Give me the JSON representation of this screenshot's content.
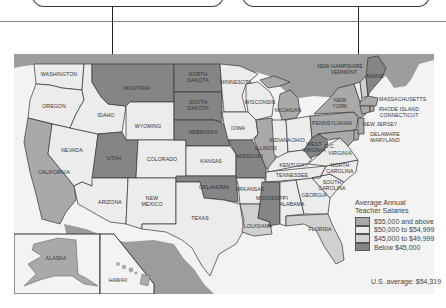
{
  "map": {
    "title": "Average Annual Teacher Salaries",
    "colors": {
      "water": "#f4f4f4",
      "canada": "#9c9c9c",
      "mexico": "#9c9c9c",
      "tier_55plus": "#a9a9a9",
      "tier_50_55": "#ececec",
      "tier_45_50": "#d0d0d0",
      "tier_below45": "#858585",
      "border": "#333333"
    },
    "states": {
      "washington": "WASHINGTON",
      "oregon": "OREGON",
      "california": "CALIFORNIA",
      "idaho": "IDAHO",
      "nevada": "NEVADA",
      "montana": "MONTANA",
      "wyoming": "WYOMING",
      "utah": "UTAH",
      "arizona": "ARIZONA",
      "colorado": "COLORADO",
      "new_mexico_1": "NEW",
      "new_mexico_2": "MEXICO",
      "north_dakota_1": "NORTH",
      "north_dakota_2": "DAKOTA",
      "south_dakota_1": "SOUTH",
      "south_dakota_2": "DAKOTA",
      "nebraska": "NEBRASKA",
      "kansas": "KANSAS",
      "oklahoma": "OKLAHOMA",
      "texas": "TEXAS",
      "minnesota": "MINNESOTA",
      "iowa": "IOWA",
      "missouri": "MISSOURI",
      "arkansas": "ARKANSAS",
      "louisiana": "LOUISIANA",
      "wisconsin": "WISCONSIN",
      "illinois": "ILLINOIS",
      "michigan": "MICHIGAN",
      "indiana": "INDIANA",
      "ohio": "OHIO",
      "kentucky": "KENTUCKY",
      "tennessee": "TENNESSEE",
      "mississippi": "MISSISSIPPI",
      "alabama": "ALABAMA",
      "georgia": "GEORGIA",
      "florida": "FLORIDA",
      "south_carolina_1": "SOUTH",
      "south_carolina_2": "CAROLINA",
      "north_carolina_1": "NORTH",
      "north_carolina_2": "CAROLINA",
      "virginia": "VIRGINIA",
      "west_virginia_1": "WEST",
      "west_virginia_2": "VIRGINIA",
      "dc": "D.C.",
      "pennsylvania": "PENNSYLVANIA",
      "new_york_1": "NEW",
      "new_york_2": "YORK",
      "maine": "MAINE",
      "new_hampshire": "NEW HAMPSHIRE",
      "vermont": "VERMONT",
      "massachusetts": "MASSACHUSETTS",
      "rhode_island": "RHODE ISLAND",
      "connecticut": "CONNECTICUT",
      "new_jersey": "NEW JERSEY",
      "delaware": "DELAWARE",
      "maryland": "MARYLAND",
      "alaska": "ALASKA",
      "hawaii": "HAWAII"
    }
  },
  "legend": {
    "title_line1": "Average Annual",
    "title_line2": "Teacher Salaries",
    "items": [
      {
        "label": "$55,000 and above",
        "color": "#a9a9a9"
      },
      {
        "label": "$50,000 to $54,999",
        "color": "#ececec"
      },
      {
        "label": "$45,000 to $49,999",
        "color": "#d0d0d0"
      },
      {
        "label": "Below $45,000",
        "color": "#858585"
      }
    ]
  },
  "footer": {
    "us_average": "U.S. average: $54,319"
  }
}
